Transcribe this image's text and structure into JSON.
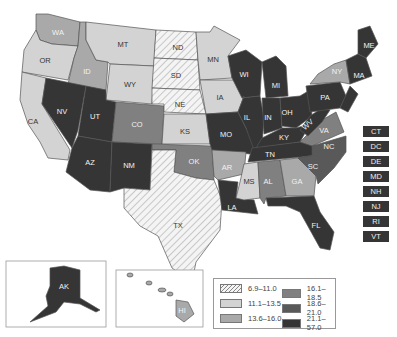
{
  "legend": {
    "items": [
      {
        "range": "6.9–11.0",
        "class": "c1"
      },
      {
        "range": "11.1–13.5",
        "class": "c2"
      },
      {
        "range": "13.6–16.0",
        "class": "c3"
      },
      {
        "range": "16.1–18.5",
        "class": "c4"
      },
      {
        "range": "18.6–21.0",
        "class": "c5"
      },
      {
        "range": "21.1–57.0",
        "class": "c6"
      }
    ]
  },
  "colors": {
    "c1": "hatch",
    "c2": "#d3d3d3",
    "c3": "#a9a9a9",
    "c4": "#808080",
    "c5": "#595959",
    "c6": "#353535"
  },
  "states": {
    "WA": "c3",
    "OR": "c2",
    "CA": "c2",
    "ID": "c3",
    "NV": "c6",
    "MT": "c2",
    "WY": "c2",
    "UT": "c6",
    "AZ": "c6",
    "CO": "c4",
    "NM": "c6",
    "ND": "c1",
    "SD": "c1",
    "NE": "c1",
    "KS": "c2",
    "OK": "c4",
    "TX": "c1",
    "MN": "c2",
    "IA": "c2",
    "MO": "c6",
    "AR": "c3",
    "LA": "c6",
    "WI": "c6",
    "IL": "c6",
    "MI": "c6",
    "IN": "c6",
    "OH": "c6",
    "KY": "c6",
    "TN": "c6",
    "MS": "c2",
    "AL": "c4",
    "GA": "c3",
    "FL": "c6",
    "SC": "c5",
    "NC": "c5",
    "VA": "c4",
    "WV": "c6",
    "PA": "c6",
    "NY": "c3",
    "ME": "c6",
    "MA": "c6",
    "AK": "c6",
    "HI": "c3"
  },
  "small_states": [
    {
      "abbr": "CT",
      "class": "c6"
    },
    {
      "abbr": "DC",
      "class": "c6"
    },
    {
      "abbr": "DE",
      "class": "c6"
    },
    {
      "abbr": "MD",
      "class": "c6"
    },
    {
      "abbr": "NH",
      "class": "c6"
    },
    {
      "abbr": "NJ",
      "class": "c6"
    },
    {
      "abbr": "RI",
      "class": "c6"
    },
    {
      "abbr": "VT",
      "class": "c6"
    }
  ],
  "labels": {
    "WA": "WA",
    "OR": "OR",
    "CA": "CA",
    "ID": "ID",
    "NV": "NV",
    "MT": "MT",
    "WY": "WY",
    "UT": "UT",
    "AZ": "AZ",
    "CO": "CO",
    "NM": "NM",
    "ND": "ND",
    "SD": "SD",
    "NE": "NE",
    "KS": "KS",
    "OK": "OK",
    "TX": "TX",
    "MN": "MN",
    "IA": "IA",
    "MO": "MO",
    "AR": "AR",
    "LA": "LA",
    "WI": "WI",
    "IL": "IL",
    "MI": "MI",
    "IN": "IN",
    "OH": "OH",
    "KY": "KY",
    "TN": "TN",
    "MS": "MS",
    "AL": "AL",
    "GA": "GA",
    "FL": "FL",
    "SC": "SC",
    "NC": "NC",
    "VA": "VA",
    "WV": "WV",
    "PA": "PA",
    "NY": "NY",
    "ME": "ME",
    "MA": "MA",
    "AK": "AK",
    "HI": "HI"
  }
}
